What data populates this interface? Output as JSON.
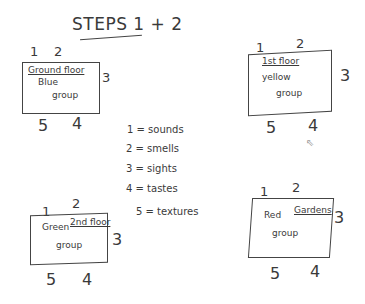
{
  "title": "STEPS 1 + 2",
  "edge_labels": {
    "top_left": "1",
    "top_right": "2",
    "right": "3",
    "bottom_right": "4",
    "bottom_left": "5"
  },
  "boxes": [
    {
      "id": "ground",
      "floor": "Ground floor",
      "group_line1": "Blue",
      "group_line2": "group"
    },
    {
      "id": "first",
      "floor": "1st floor",
      "group_line1": "yellow",
      "group_line2": "group"
    },
    {
      "id": "second",
      "floor": "2nd floor",
      "group_line1": "Green",
      "group_line2": "group"
    },
    {
      "id": "gardens",
      "floor": "Gardens",
      "group_line1": "Red",
      "group_line2": "group"
    }
  ],
  "legend": [
    {
      "key": "1",
      "text": "1 = sounds"
    },
    {
      "key": "2",
      "text": "2 = smells"
    },
    {
      "key": "3",
      "text": "3 = sights"
    },
    {
      "key": "4",
      "text": "4 = tastes"
    },
    {
      "key": "5",
      "text": "5 = textures"
    }
  ]
}
